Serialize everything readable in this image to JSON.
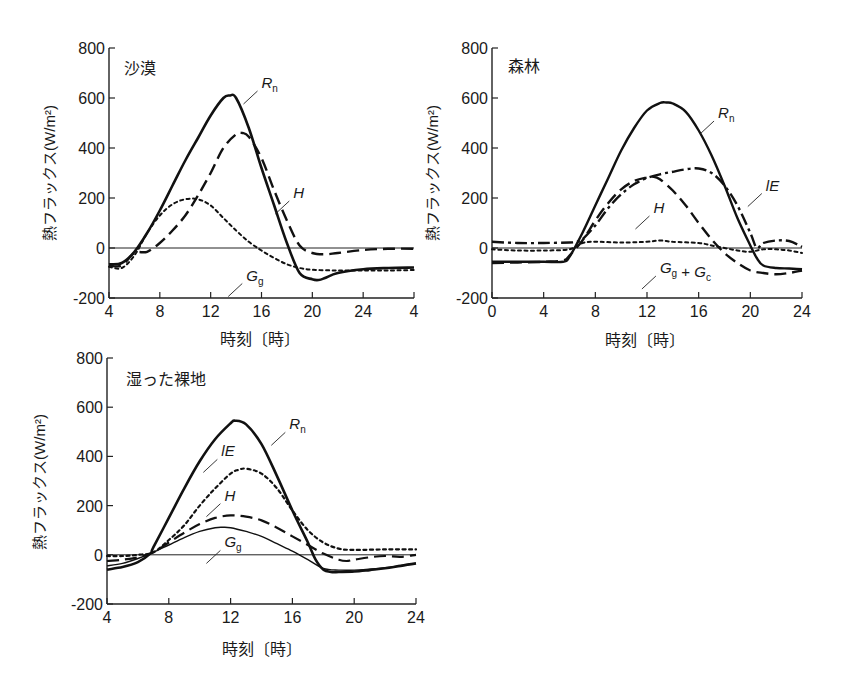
{
  "chart_data": [
    {
      "type": "line",
      "title": "沙漠",
      "xlabel": "時刻〔時〕",
      "ylabel": "熱フラックス(W/m²)",
      "xlim": [
        4,
        28
      ],
      "ylim": [
        -200,
        800
      ],
      "x_ticks": [
        4,
        8,
        12,
        16,
        20,
        24,
        28
      ],
      "x_tick_labels": [
        "4",
        "8",
        "12",
        "16",
        "20",
        "24",
        "4"
      ],
      "y_ticks": [
        -200,
        0,
        200,
        400,
        600,
        800
      ],
      "y_tick_labels": [
        "-200",
        "0",
        "200",
        "400",
        "600",
        "800"
      ],
      "grid": false,
      "zero_line": true,
      "series": [
        {
          "name": "Rn",
          "label": "R",
          "sub": "n",
          "style": "solid",
          "width": 2.6,
          "x": [
            4,
            5,
            6,
            7,
            8,
            9,
            10,
            11,
            12,
            13,
            13.5,
            14,
            15,
            16,
            17,
            18,
            19,
            20,
            20.5,
            21,
            22,
            24,
            26,
            28
          ],
          "y": [
            -65,
            -60,
            -15,
            60,
            150,
            250,
            350,
            440,
            530,
            600,
            610,
            600,
            480,
            320,
            170,
            20,
            -100,
            -125,
            -128,
            -120,
            -100,
            -85,
            -80,
            -78
          ]
        },
        {
          "name": "H",
          "label": "H",
          "sub": "",
          "style": "dashed",
          "width": 2.4,
          "x": [
            4,
            5,
            6,
            7,
            8,
            9,
            10,
            11,
            12,
            13,
            14,
            14.5,
            15,
            16,
            17,
            18,
            19,
            20,
            21,
            22,
            24,
            26,
            28
          ],
          "y": [
            -70,
            -70,
            -20,
            -15,
            20,
            70,
            130,
            210,
            300,
            400,
            455,
            460,
            445,
            360,
            230,
            110,
            10,
            -20,
            -25,
            -20,
            -8,
            -3,
            -3
          ]
        },
        {
          "name": "Gg",
          "label": "G",
          "sub": "g",
          "style": "dotted",
          "width": 2.0,
          "x": [
            4,
            5,
            6,
            7,
            8,
            9,
            10,
            11,
            12,
            13,
            14,
            15,
            16,
            17,
            18,
            19,
            20,
            22,
            24,
            26,
            28
          ],
          "y": [
            -75,
            -80,
            -30,
            60,
            130,
            175,
            195,
            195,
            170,
            120,
            70,
            25,
            -10,
            -40,
            -65,
            -80,
            -87,
            -90,
            -90,
            -90,
            -88
          ]
        }
      ],
      "annotations": [
        {
          "text": "Rn",
          "x": 16,
          "y": 640
        },
        {
          "text": "H",
          "x": 18.5,
          "y": 200
        },
        {
          "text": "Gg",
          "x": 14.8,
          "y": -130
        }
      ]
    },
    {
      "type": "line",
      "title": "森林",
      "xlabel": "時刻〔時〕",
      "ylabel": "熱フラックス(W/m²)",
      "xlim": [
        0,
        24
      ],
      "ylim": [
        -200,
        800
      ],
      "x_ticks": [
        0,
        4,
        8,
        12,
        16,
        20,
        24
      ],
      "x_tick_labels": [
        "0",
        "4",
        "8",
        "12",
        "16",
        "20",
        "24"
      ],
      "y_ticks": [
        -200,
        0,
        200,
        400,
        600,
        800
      ],
      "y_tick_labels": [
        "-200",
        "0",
        "200",
        "400",
        "600",
        "800"
      ],
      "grid": false,
      "zero_line": true,
      "series": [
        {
          "name": "Rn",
          "label": "R",
          "sub": "n",
          "style": "solid",
          "width": 2.4,
          "x": [
            0,
            2,
            4,
            5.5,
            6,
            7,
            8,
            9,
            10,
            11,
            12,
            13,
            13.5,
            14,
            15,
            16,
            17,
            18,
            19,
            20,
            20.5,
            21,
            22,
            23,
            24
          ],
          "y": [
            -55,
            -55,
            -55,
            -55,
            -35,
            60,
            170,
            280,
            390,
            480,
            550,
            580,
            582,
            578,
            545,
            470,
            370,
            250,
            120,
            10,
            -40,
            -70,
            -80,
            -82,
            -85
          ]
        },
        {
          "name": "lE",
          "label": "lE",
          "sub": "",
          "style": "dashdot",
          "width": 2.4,
          "x": [
            0,
            2,
            4,
            6,
            6.5,
            7,
            8,
            9,
            10,
            11,
            12,
            13,
            14,
            15,
            16,
            17,
            18,
            19,
            20,
            20.5,
            21,
            22,
            23,
            24
          ],
          "y": [
            25,
            20,
            20,
            22,
            25,
            35,
            90,
            160,
            215,
            255,
            280,
            295,
            305,
            315,
            318,
            300,
            250,
            170,
            60,
            0,
            20,
            30,
            28,
            5
          ]
        },
        {
          "name": "H",
          "label": "H",
          "sub": "",
          "style": "dashed",
          "width": 2.4,
          "x": [
            0,
            2,
            4,
            5.5,
            6,
            7,
            8,
            9,
            10,
            11,
            12,
            12.5,
            13,
            14,
            15,
            16,
            17,
            18,
            19,
            20,
            21,
            22,
            23,
            24
          ],
          "y": [
            -60,
            -58,
            -55,
            -50,
            -30,
            30,
            110,
            180,
            235,
            268,
            282,
            285,
            275,
            230,
            170,
            100,
            35,
            -20,
            -60,
            -90,
            -100,
            -105,
            -100,
            -90
          ]
        },
        {
          "name": "Gg+Gc",
          "label": "G",
          "sub": "g",
          "label2": "G",
          "sub2": "c",
          "style": "dotted",
          "width": 2.0,
          "x": [
            0,
            2,
            4,
            6,
            7,
            8,
            10,
            12,
            13,
            14,
            16,
            17,
            18,
            19,
            20,
            21,
            22,
            23,
            24
          ],
          "y": [
            -5,
            -10,
            -10,
            -5,
            20,
            25,
            22,
            25,
            30,
            25,
            20,
            10,
            0,
            -10,
            -15,
            -5,
            -5,
            -10,
            -20
          ]
        }
      ],
      "annotations": [
        {
          "text": "Rn",
          "x": 17.5,
          "y": 520
        },
        {
          "text": "lE",
          "x": 21.2,
          "y": 230
        },
        {
          "text": "H",
          "x": 12.5,
          "y": 140
        },
        {
          "text": "Gg + Gc",
          "x": 13,
          "y": -100
        }
      ]
    },
    {
      "type": "line",
      "title": "湿った裸地",
      "xlabel": "時刻〔時〕",
      "ylabel": "熱フラックス(W/m²)",
      "xlim": [
        4,
        24
      ],
      "ylim": [
        -200,
        800
      ],
      "x_ticks": [
        4,
        8,
        12,
        16,
        20,
        24
      ],
      "x_tick_labels": [
        "4",
        "8",
        "12",
        "16",
        "20",
        "24"
      ],
      "y_ticks": [
        -200,
        0,
        200,
        400,
        600,
        800
      ],
      "y_tick_labels": [
        "-200",
        "0",
        "200",
        "400",
        "600",
        "800"
      ],
      "grid": false,
      "zero_line": true,
      "series": [
        {
          "name": "Rn",
          "label": "R",
          "sub": "n",
          "style": "solid",
          "width": 2.6,
          "x": [
            4,
            5,
            6,
            6.8,
            7,
            8,
            9,
            10,
            11,
            12,
            12.3,
            13,
            14,
            15,
            16,
            17,
            17.5,
            18,
            18.5,
            19,
            20,
            21,
            22,
            23,
            24
          ],
          "y": [
            -60,
            -50,
            -30,
            5,
            30,
            150,
            270,
            380,
            470,
            535,
            545,
            530,
            450,
            320,
            180,
            50,
            -20,
            -60,
            -70,
            -70,
            -68,
            -62,
            -55,
            -45,
            -35
          ]
        },
        {
          "name": "lE",
          "label": "lE",
          "sub": "",
          "style": "dotted",
          "width": 2.2,
          "x": [
            4,
            5,
            6,
            7,
            8,
            9,
            10,
            11,
            12,
            12.5,
            13,
            14,
            15,
            16,
            17,
            18,
            19,
            20,
            22,
            24
          ],
          "y": [
            -5,
            -5,
            0,
            10,
            60,
            120,
            200,
            270,
            330,
            345,
            350,
            330,
            270,
            180,
            100,
            50,
            25,
            20,
            22,
            22
          ]
        },
        {
          "name": "H",
          "label": "H",
          "sub": "",
          "style": "dashed",
          "width": 2.2,
          "x": [
            4,
            5,
            6,
            7,
            8,
            9,
            10,
            11,
            12,
            13,
            14,
            15,
            16,
            17,
            18,
            19,
            19.5,
            20,
            21,
            22,
            23,
            24
          ],
          "y": [
            -25,
            -20,
            -10,
            10,
            50,
            90,
            125,
            150,
            160,
            155,
            140,
            110,
            75,
            40,
            5,
            -20,
            -25,
            -20,
            -10,
            -5,
            -8,
            0
          ]
        },
        {
          "name": "Gg",
          "label": "G",
          "sub": "g",
          "style": "solid-thin",
          "width": 1.4,
          "x": [
            4,
            5,
            6,
            7,
            8,
            9,
            10,
            11,
            11.5,
            12,
            13,
            14,
            15,
            16,
            17,
            18,
            19,
            20,
            22,
            24
          ],
          "y": [
            -45,
            -35,
            -15,
            10,
            40,
            70,
            95,
            110,
            112,
            110,
            95,
            75,
            45,
            15,
            -20,
            -55,
            -62,
            -62,
            -52,
            -35
          ]
        }
      ],
      "annotations": [
        {
          "text": "Rn",
          "x": 15.8,
          "y": 510
        },
        {
          "text": "lE",
          "x": 11.4,
          "y": 400
        },
        {
          "text": "H",
          "x": 11.6,
          "y": 220
        },
        {
          "text": "Gg",
          "x": 11.6,
          "y": 30
        }
      ]
    }
  ],
  "panels": [
    {
      "title": "沙漠",
      "xlabel": "時刻〔時〕",
      "ylabel": "熱フラックス(W/m²)"
    },
    {
      "title": "森林",
      "xlabel": "時刻〔時〕",
      "ylabel": "熱フラックス(W/m²)"
    },
    {
      "title": "湿った裸地",
      "xlabel": "時刻〔時〕",
      "ylabel": "熱フラックス(W/m²)"
    }
  ]
}
